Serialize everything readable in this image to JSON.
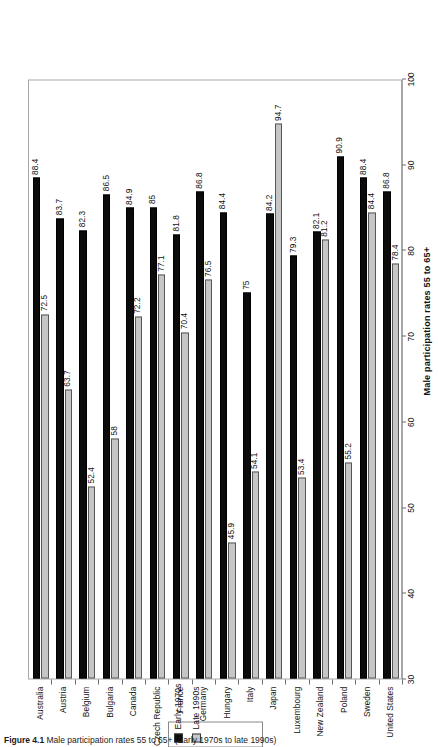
{
  "figure": {
    "caption_label": "Figure 4.1",
    "caption_text": "  Male participation rates 55 to 65+ (Early 1970s to late 1990s)"
  },
  "legend": {
    "position": "top",
    "items": [
      {
        "label": "Early 1970s",
        "color": "#0b0b0b"
      },
      {
        "label": "Late 1990s",
        "color": "#c6c6c6"
      }
    ]
  },
  "chart_data": {
    "type": "bar",
    "title": "Male participation rates 55 to 65+",
    "xlabel": "",
    "ylabel": "",
    "ylim": [
      30,
      100
    ],
    "yticks": [
      30,
      40,
      50,
      60,
      70,
      80,
      90,
      100
    ],
    "grid": false,
    "legend_position": "top",
    "orientation": "vertical-rotated-page",
    "categories": [
      "Australia",
      "Austria",
      "Belgium",
      "Bulgaria",
      "Canada",
      "Czech Republic",
      "France",
      "Germany",
      "Hungary",
      "Italy",
      "Japan",
      "Luxembourg",
      "New Zealand",
      "Poland",
      "Sweden",
      "United States"
    ],
    "series": [
      {
        "name": "Early 1970s",
        "color": "#0b0b0b",
        "values": [
          88.4,
          83.7,
          82.3,
          86.5,
          84.9,
          85,
          81.8,
          86.8,
          84.4,
          75,
          84.2,
          79.3,
          82.1,
          90.9,
          88.4,
          86.8
        ],
        "labels": [
          "88.4",
          "83.7",
          "82.3",
          "86.5",
          "84.9",
          "85",
          "81.8",
          "86.8",
          "84.4",
          "75",
          "84.2",
          "79.3",
          "82.1",
          "90.9",
          "88.4",
          "86.8"
        ]
      },
      {
        "name": "Late 1990s",
        "color": "#c6c6c6",
        "values": [
          72.5,
          63.7,
          52.4,
          58,
          72.2,
          77.1,
          70.4,
          76.5,
          45.9,
          54.1,
          94.7,
          53.4,
          81.2,
          55.2,
          84.4,
          78.4
        ],
        "labels": [
          "72.5",
          "63.7",
          "52.4",
          "58",
          "72.2",
          "77.1",
          "70.4",
          "76.5",
          "45.9",
          "54.1",
          "94.7",
          "53.4",
          "81.2",
          "55.2",
          "84.4",
          "78.4"
        ]
      }
    ]
  }
}
